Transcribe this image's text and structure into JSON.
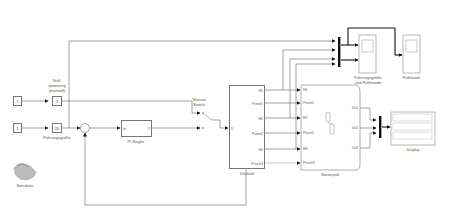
{
  "diagram": {
    "type": "simulink-block-diagram",
    "blocks": {
      "const1": {
        "label": "",
        "value": "1"
      },
      "const2": {
        "label": "",
        "value": "1"
      },
      "gain_stell": {
        "label_line1": "Stell-",
        "label_line2": "spannung",
        "label_line3": "(manuell)",
        "value": "1"
      },
      "gain_fuehr": {
        "label": "Führungsgröße",
        "value": "20"
      },
      "sum": {
        "label": ""
      },
      "pi": {
        "label": "PI-Regler",
        "in": "In",
        "out": "Y"
      },
      "switch": {
        "label_line1": "Manual",
        "label_line2": "Switch"
      },
      "drehteil": {
        "label": "Drehteil",
        "in": "U",
        "outputs": [
          "H1",
          "Pvent1",
          "H2",
          "Pvent2",
          "H3",
          "Pzuch3"
        ]
      },
      "steuerpult": {
        "label": "Steuerpult",
        "inputs": [
          "H1",
          "Pvent1",
          "H2",
          "Pvent2",
          "H3",
          "Pzuch3"
        ],
        "outputs": [
          "Us1",
          "Us2",
          "Us3"
        ]
      },
      "scope1": {
        "label_line1": "Führungsgröße",
        "label_line2": "und Füllstände"
      },
      "scope2": {
        "label": "Füllstand~"
      },
      "display": {
        "label": "Display"
      },
      "simulink_icon": {
        "label": "Simulator"
      }
    }
  }
}
